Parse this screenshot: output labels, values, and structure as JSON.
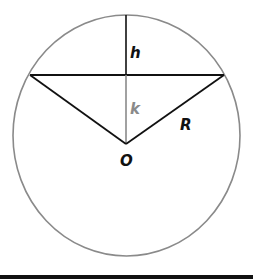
{
  "diagram": {
    "type": "circle-segment-geometry",
    "labels": {
      "h": "h",
      "k": "k",
      "R": "R",
      "O": "O"
    },
    "colors": {
      "circle": "#8a8a8a",
      "lines": "#111111",
      "k_segment": "#8a8a8a",
      "k_label": "#8a8a8a",
      "text": "#111111",
      "background": "#ffffff",
      "bottom_bar": "#111111"
    },
    "geometry": {
      "center": [
        126,
        144
      ],
      "circle_center": [
        126.5,
        135.5
      ],
      "circle_rx": 113.5,
      "circle_ry": 120.5,
      "chord_y": 75,
      "chord_left": [
        30,
        75
      ],
      "chord_right": [
        224,
        75
      ],
      "top_point": [
        126,
        15
      ]
    }
  }
}
